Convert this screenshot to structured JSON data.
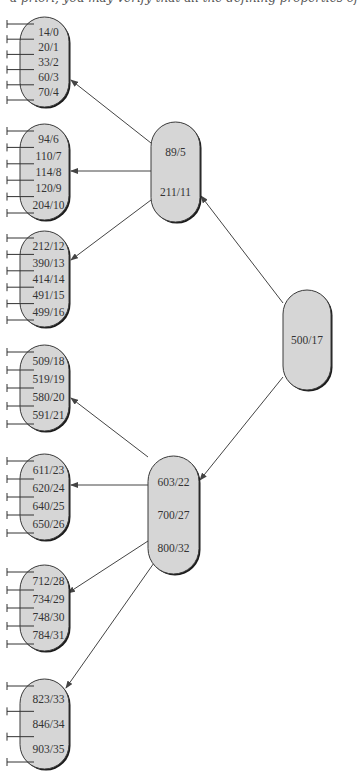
{
  "caption": "a priori, you may verify that all the defining properties of",
  "colors": {
    "node_fill": "#d6d6d6",
    "node_border": "#3a3a3a",
    "node_shadow": "#1a1a1a",
    "edge": "#444444",
    "text": "#333333"
  },
  "tree": {
    "root": {
      "id": "root",
      "keys": [
        "500/17"
      ],
      "x": 283,
      "y": 290,
      "w": 48,
      "h": 100
    },
    "internal": [
      {
        "id": "internal-1",
        "keys": [
          "89/5",
          "211/11"
        ],
        "x": 151,
        "y": 122,
        "w": 49,
        "h": 100
      },
      {
        "id": "internal-2",
        "keys": [
          "603/22",
          "700/27",
          "800/32"
        ],
        "x": 148,
        "y": 456,
        "w": 51,
        "h": 118
      }
    ],
    "leaves": [
      {
        "id": "leaf-1",
        "keys": [
          "14/0",
          "20/1",
          "33/2",
          "60/3",
          "70/4"
        ],
        "x": 20,
        "y": 17,
        "w": 49,
        "h": 90
      },
      {
        "id": "leaf-2",
        "keys": [
          "94/6",
          "110/7",
          "114/8",
          "120/9",
          "204/10"
        ],
        "x": 20,
        "y": 124,
        "w": 49,
        "h": 96
      },
      {
        "id": "leaf-3",
        "keys": [
          "212/12",
          "390/13",
          "414/14",
          "491/15",
          "499/16"
        ],
        "x": 20,
        "y": 231,
        "w": 49,
        "h": 96
      },
      {
        "id": "leaf-4",
        "keys": [
          "509/18",
          "519/19",
          "580/20",
          "591/21"
        ],
        "x": 20,
        "y": 345,
        "w": 49,
        "h": 86
      },
      {
        "id": "leaf-5",
        "keys": [
          "611/23",
          "620/24",
          "640/25",
          "650/26"
        ],
        "x": 20,
        "y": 454,
        "w": 49,
        "h": 86
      },
      {
        "id": "leaf-6",
        "keys": [
          "712/28",
          "734/29",
          "748/30",
          "784/31"
        ],
        "x": 20,
        "y": 565,
        "w": 49,
        "h": 86
      },
      {
        "id": "leaf-7",
        "keys": [
          "823/33",
          "846/34",
          "903/35"
        ],
        "x": 20,
        "y": 679,
        "w": 49,
        "h": 90
      }
    ],
    "edges": [
      {
        "from": "root",
        "to": "internal-1",
        "x1": 283,
        "y1": 303,
        "x2": 201,
        "y2": 196
      },
      {
        "from": "root",
        "to": "internal-2",
        "x1": 283,
        "y1": 377,
        "x2": 200,
        "y2": 480
      },
      {
        "from": "internal-1",
        "to": "leaf-1",
        "x1": 151,
        "y1": 143,
        "x2": 71,
        "y2": 80
      },
      {
        "from": "internal-1",
        "to": "leaf-2",
        "x1": 151,
        "y1": 171,
        "x2": 71,
        "y2": 171
      },
      {
        "from": "internal-1",
        "to": "leaf-3",
        "x1": 151,
        "y1": 200,
        "x2": 71,
        "y2": 260
      },
      {
        "from": "internal-2",
        "to": "leaf-4",
        "x1": 148,
        "y1": 457,
        "x2": 71,
        "y2": 398
      },
      {
        "from": "internal-2",
        "to": "leaf-5",
        "x1": 148,
        "y1": 485,
        "x2": 71,
        "y2": 485
      },
      {
        "from": "internal-2",
        "to": "leaf-6",
        "x1": 148,
        "y1": 541,
        "x2": 68,
        "y2": 593
      },
      {
        "from": "internal-2",
        "to": "leaf-7",
        "x1": 161,
        "y1": 553,
        "x2": 66,
        "y2": 688
      }
    ]
  }
}
